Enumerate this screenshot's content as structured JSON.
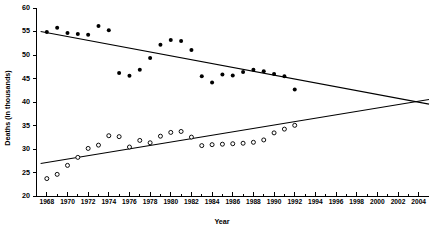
{
  "chart_data": {
    "type": "scatter",
    "title": "",
    "xlabel": "Year",
    "ylabel": "Deaths (in thousands)",
    "xlim": [
      1967,
      2005
    ],
    "ylim": [
      20,
      60
    ],
    "grid": false,
    "legend": "none",
    "y_ticks": [
      20,
      25,
      30,
      35,
      40,
      45,
      50,
      55,
      60
    ],
    "y_tick_labels": [
      "20",
      "25",
      "30",
      "35",
      "40",
      "45",
      "50",
      "55",
      "60"
    ],
    "x_ticks": [
      1968,
      1970,
      1972,
      1974,
      1976,
      1978,
      1980,
      1982,
      1984,
      1986,
      1988,
      1990,
      1992,
      1994,
      1996,
      1998,
      2000,
      2002,
      2004
    ],
    "x_tick_labels": [
      "1968",
      "1970",
      "1972",
      "1974",
      "1976",
      "1978",
      "1980",
      "1982",
      "1984",
      "1986",
      "1988",
      "1990",
      "1992",
      "1994",
      "1996",
      "1998",
      "2000",
      "2002",
      "2004"
    ],
    "x_minor_ticks": [
      1969,
      1971,
      1973,
      1975,
      1977,
      1979,
      1981,
      1983,
      1985,
      1987,
      1989,
      1991,
      1993,
      1995,
      1997,
      1999,
      2001,
      2003
    ],
    "series": [
      {
        "name": "filled-circles",
        "marker": "filled-circle",
        "color": "#000000",
        "x": [
          1968,
          1969,
          1970,
          1971,
          1972,
          1973,
          1974,
          1975,
          1976,
          1977,
          1978,
          1979,
          1980,
          1981,
          1982,
          1983,
          1984,
          1985,
          1986,
          1987,
          1988,
          1989,
          1990,
          1991,
          1992
        ],
        "y": [
          54.9,
          55.8,
          54.7,
          54.5,
          54.3,
          56.2,
          55.3,
          46.2,
          45.6,
          46.9,
          49.4,
          52.2,
          53.2,
          53.0,
          51.1,
          45.5,
          44.2,
          45.9,
          45.7,
          46.4,
          46.9,
          46.6,
          46.0,
          45.5,
          42.7
        ],
        "trend": {
          "x": [
            1967.4,
            2005.0
          ],
          "y": [
            55.0,
            39.6
          ]
        }
      },
      {
        "name": "open-circles",
        "marker": "open-circle",
        "color": "#000000",
        "x": [
          1968,
          1969,
          1970,
          1971,
          1972,
          1973,
          1974,
          1975,
          1976,
          1977,
          1978,
          1979,
          1980,
          1981,
          1982,
          1983,
          1984,
          1985,
          1986,
          1987,
          1988,
          1989,
          1990,
          1991,
          1992
        ],
        "y": [
          23.8,
          24.7,
          26.6,
          28.3,
          30.2,
          30.9,
          32.9,
          32.7,
          30.5,
          31.9,
          31.4,
          32.8,
          33.6,
          33.8,
          32.6,
          30.8,
          31.0,
          31.1,
          31.2,
          31.3,
          31.5,
          32.0,
          33.5,
          34.3,
          35.1
        ],
        "trend": {
          "x": [
            1967.4,
            2005.0
          ],
          "y": [
            27.0,
            40.6
          ]
        }
      }
    ]
  },
  "axes": {
    "x_title": "Year",
    "y_title": "Deaths (in thousands)"
  }
}
